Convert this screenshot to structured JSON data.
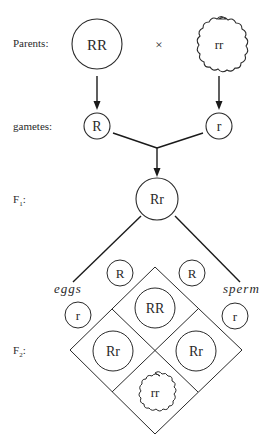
{
  "figure": {
    "row_labels": {
      "parents": "Parents:",
      "gametes": "gametes:",
      "f1": "F",
      "f1_sub": "1",
      "f1_colon": ":",
      "f2": "F",
      "f2_sub": "2",
      "f2_colon": ":"
    },
    "cross_symbol": "×",
    "parents": [
      {
        "genotype": "RR",
        "shape": "round"
      },
      {
        "genotype": "rr",
        "shape": "wrinkled"
      }
    ],
    "gametes": [
      {
        "allele": "R"
      },
      {
        "allele": "r"
      }
    ],
    "f1": {
      "genotype": "Rr",
      "shape": "round"
    },
    "punnett": {
      "eggs_label": "eggs",
      "sperm_label": "sperm",
      "eggs": [
        "R",
        "r"
      ],
      "sperm": [
        "R",
        "r"
      ],
      "cells": [
        {
          "position": "top",
          "genotype": "RR",
          "shape": "round"
        },
        {
          "position": "left",
          "genotype": "Rr",
          "shape": "round"
        },
        {
          "position": "right",
          "genotype": "Rr",
          "shape": "round"
        },
        {
          "position": "bottom",
          "genotype": "rr",
          "shape": "wrinkled"
        }
      ]
    }
  }
}
